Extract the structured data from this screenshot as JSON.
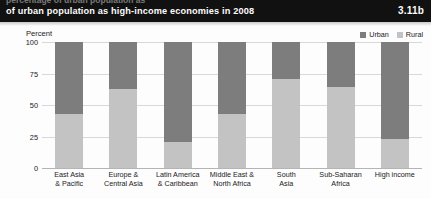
{
  "header": {
    "cut_off_line": "percentage of urban population as",
    "title": "of urban population as high-income economies in 2008",
    "figure_number": "3.11b",
    "background_color": "#111111",
    "text_color": "#ffffff"
  },
  "legend": {
    "items": [
      {
        "label": "Urban",
        "color": "#7d7d7d"
      },
      {
        "label": "Rural",
        "color": "#c3c3c3"
      }
    ]
  },
  "axis": {
    "y_title": "Percent",
    "y_ticks": [
      "100",
      "75",
      "50",
      "25",
      "0"
    ]
  },
  "chart_data": {
    "type": "bar",
    "title": "of urban population as high-income economies in 2008",
    "subtitle": "",
    "xlabel": "",
    "ylabel": "Percent",
    "ylim": [
      0,
      100
    ],
    "grid": true,
    "stacked": true,
    "legend_position": "top-right",
    "categories": [
      "East Asia & Pacific",
      "Europe & Central Asia",
      "Latin America & Caribbean",
      "Middle East & North Africa",
      "South Asia",
      "Sub-Saharan Africa",
      "High income"
    ],
    "category_lines": [
      [
        "East Asia",
        "& Pacific"
      ],
      [
        "Europe &",
        "Central Asia"
      ],
      [
        "Latin America",
        "& Caribbean"
      ],
      [
        "Middle East &",
        "North Africa"
      ],
      [
        "South",
        "Asia"
      ],
      [
        "Sub-Saharan",
        "Africa"
      ],
      [
        "High income",
        ""
      ]
    ],
    "series": [
      {
        "name": "Urban",
        "color": "#7d7d7d",
        "values": [
          57,
          37,
          79,
          57,
          29,
          36,
          77
        ]
      },
      {
        "name": "Rural",
        "color": "#c3c3c3",
        "values": [
          43,
          63,
          21,
          43,
          71,
          64,
          23
        ]
      }
    ]
  }
}
